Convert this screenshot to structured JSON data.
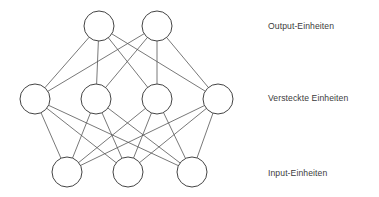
{
  "diagram": {
    "type": "neural-network",
    "title": "",
    "background_color": "#ffffff",
    "node_fill": "#ffffff",
    "node_stroke": "#444444",
    "edge_color": "#555555",
    "text_color": "#3b3b3b",
    "node_radius": 15,
    "layers": [
      {
        "id": "output",
        "label": "Output-Einheiten",
        "label_x": 268,
        "label_y": 26,
        "count": 2,
        "y": 26,
        "nodes": [
          {
            "cx": 99,
            "cy": 26
          },
          {
            "cx": 157,
            "cy": 26
          }
        ]
      },
      {
        "id": "hidden",
        "label": "Versteckte Einheiten",
        "label_x": 268,
        "label_y": 98,
        "count": 4,
        "y": 99,
        "nodes": [
          {
            "cx": 35,
            "cy": 99
          },
          {
            "cx": 96,
            "cy": 99
          },
          {
            "cx": 157,
            "cy": 99
          },
          {
            "cx": 218,
            "cy": 99
          }
        ]
      },
      {
        "id": "input",
        "label": "Input-Einheiten",
        "label_x": 268,
        "label_y": 173,
        "count": 3,
        "y": 172,
        "nodes": [
          {
            "cx": 67,
            "cy": 172
          },
          {
            "cx": 128,
            "cy": 172
          },
          {
            "cx": 192,
            "cy": 172
          }
        ]
      }
    ],
    "connections": [
      {
        "from_layer": "hidden",
        "to_layer": "output",
        "pattern": "fully-connected",
        "edge_count": 8
      },
      {
        "from_layer": "input",
        "to_layer": "hidden",
        "pattern": "fully-connected",
        "edge_count": 12
      }
    ]
  }
}
